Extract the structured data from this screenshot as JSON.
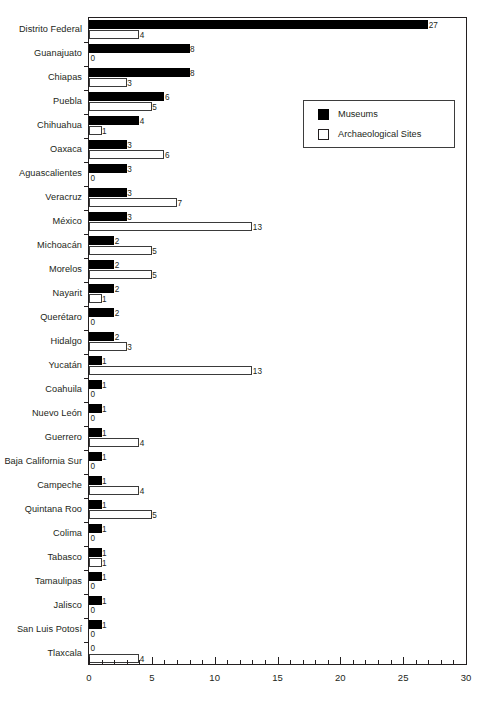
{
  "chart_data": {
    "type": "bar",
    "orientation": "horizontal",
    "title": "",
    "subtitle": "",
    "xlabel": "",
    "ylabel": "",
    "xlim": [
      0,
      30
    ],
    "xticks": [
      0,
      5,
      10,
      15,
      20,
      25,
      30
    ],
    "xtick_labels": [
      "0",
      "5",
      "10",
      "15",
      "20",
      "25",
      "30"
    ],
    "minor_tick_step": 1,
    "grid": false,
    "legend_position": "upper-right-inside",
    "categories": [
      "Distrito Federal",
      "Guanajuato",
      "Chiapas",
      "Puebla",
      "Chihuahua",
      "Oaxaca",
      "Aguascalientes",
      "Veracruz",
      "México",
      "Michoacán",
      "Morelos",
      "Nayarit",
      "Querétaro",
      "Hidalgo",
      "Yucatán",
      "Coahuila",
      "Nuevo León",
      "Guerrero",
      "Baja California Sur",
      "Campeche",
      "Quintana Roo",
      "Colima",
      "Tabasco",
      "Tamaulipas",
      "Jalisco",
      "San Luis Potosí",
      "Tlaxcala"
    ],
    "series": [
      {
        "name": "Museums",
        "color": "#000000",
        "style": "filled",
        "values": [
          27,
          8,
          8,
          6,
          4,
          3,
          3,
          3,
          3,
          2,
          2,
          2,
          2,
          2,
          1,
          1,
          1,
          1,
          1,
          1,
          1,
          1,
          1,
          1,
          1,
          1,
          0
        ]
      },
      {
        "name": "Archaeological Sites",
        "color": "#ffffff",
        "style": "hollow",
        "values": [
          4,
          0,
          3,
          5,
          1,
          6,
          0,
          7,
          13,
          5,
          5,
          1,
          0,
          3,
          13,
          0,
          0,
          4,
          0,
          4,
          5,
          0,
          1,
          0,
          0,
          0,
          4
        ]
      }
    ]
  },
  "legend": {
    "items": [
      {
        "label": "Museums",
        "swatch": "filled-square"
      },
      {
        "label": "Archaeological Sites",
        "swatch": "hollow-square"
      }
    ]
  }
}
